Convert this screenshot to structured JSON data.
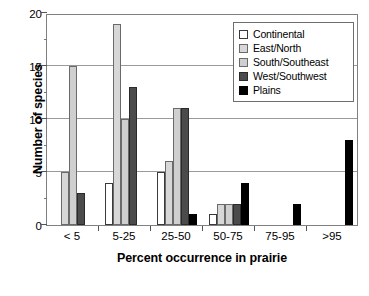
{
  "chart_data": {
    "type": "bar",
    "title": "",
    "xlabel": "Percent occurrence in prairie",
    "ylabel": "Number of species",
    "categories": [
      "< 5",
      "5-25",
      "25-50",
      "50-75",
      "75-95",
      ">95"
    ],
    "series": [
      {
        "name": "Continental",
        "color": "#ffffff",
        "values": [
          0,
          4,
          5,
          1,
          0,
          0
        ]
      },
      {
        "name": "East/North",
        "color": "#d7d7d7",
        "values": [
          5,
          19,
          6,
          2,
          0,
          0
        ]
      },
      {
        "name": "South/Southeast",
        "color": "#cfcfcf",
        "values": [
          15,
          10,
          11,
          2,
          0,
          0
        ]
      },
      {
        "name": "West/Southwest",
        "color": "#4b4b4b",
        "values": [
          3,
          13,
          11,
          2,
          0,
          0
        ]
      },
      {
        "name": "Plains",
        "color": "#000000",
        "values": [
          0,
          0,
          1,
          4,
          2,
          8
        ]
      }
    ],
    "ylim": [
      0,
      20
    ],
    "ytick_labels": [
      "0",
      "5",
      "10",
      "15",
      "20"
    ],
    "ytick_values": [
      0,
      5,
      10,
      15,
      20
    ],
    "yminor_values": [
      2.5,
      7.5,
      12.5,
      17.5
    ],
    "gridlines": [
      5,
      10,
      15
    ],
    "grid": true,
    "legend_position": "top-right",
    "legend_entries": [
      "Continental",
      "East/North",
      "South/Southeast",
      "West/Southwest",
      "Plains"
    ]
  }
}
